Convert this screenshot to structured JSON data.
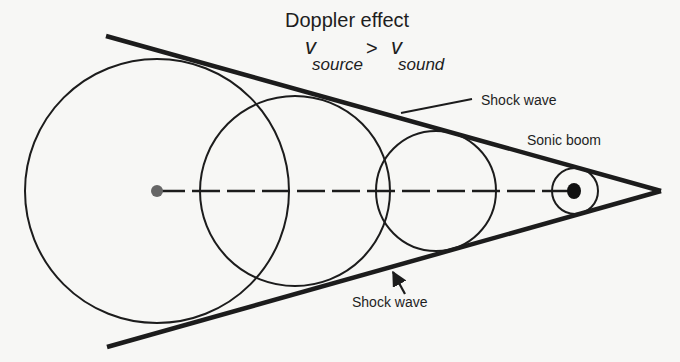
{
  "diagram": {
    "title": "Doppler effect",
    "formula": {
      "left_symbol": "v",
      "left_subscript": "source",
      "operator": ">",
      "right_symbol": "v",
      "right_subscript": "sound"
    },
    "labels": {
      "shock_wave_top": "Shock wave",
      "shock_wave_bottom": "Shock wave",
      "sonic_boom": "Sonic boom"
    },
    "colors": {
      "background": "#f7f7f5",
      "stroke": "#1c1c1c",
      "source_dot": "#666666",
      "current_dot": "#111111"
    },
    "geometry": {
      "cone_tip": [
        661,
        191
      ],
      "cone_upper_start": [
        106,
        36
      ],
      "cone_lower_start": [
        107,
        347
      ],
      "path_axis_y": 191,
      "wavefronts": [
        {
          "cx": 157,
          "cy": 191,
          "r": 132
        },
        {
          "cx": 295,
          "cy": 191,
          "r": 95
        },
        {
          "cx": 436,
          "cy": 191,
          "r": 60
        },
        {
          "cx": 575,
          "cy": 191,
          "r": 23
        }
      ],
      "source_start": {
        "cx": 157,
        "cy": 191,
        "r": 6
      },
      "source_now": {
        "cx": 574,
        "cy": 191,
        "rx": 7,
        "ry": 8
      }
    }
  }
}
